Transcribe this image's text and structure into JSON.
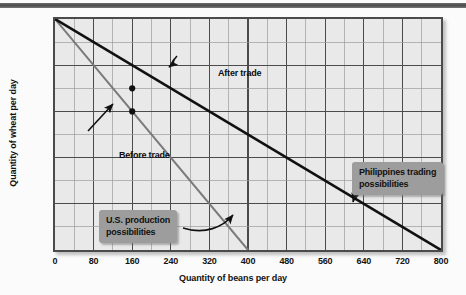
{
  "figure": {
    "background_color": "#fbfbfb",
    "plot_fill": "#e9e9e9",
    "frame_color": "#4b4b4b",
    "callout_color": "#9d9d9d"
  },
  "chart_data": {
    "type": "line",
    "title": "",
    "xlabel": "Quantity of beans per day",
    "ylabel": "Quantity of wheat per day",
    "xlim": [
      0,
      800
    ],
    "ylim": [
      0,
      400
    ],
    "xticks": [
      0,
      80,
      160,
      240,
      320,
      400,
      480,
      560,
      640,
      720,
      800
    ],
    "yticks": [
      0,
      80,
      160,
      240,
      320,
      400
    ],
    "xtick_labels": [
      "0",
      "80",
      "160",
      "240",
      "320",
      "400",
      "480",
      "560",
      "640",
      "720",
      "800"
    ],
    "ytick_labels": [
      "0",
      "80",
      "160",
      "240",
      "320",
      "400"
    ],
    "grid": true,
    "grid_major_step_x": 80,
    "grid_minor_step_x": 40,
    "grid_major_step_y": 80,
    "grid_minor_step_y": 40,
    "legend": "none",
    "series": [
      {
        "name": "U.S. production possibilities",
        "color": "#7a7a7a",
        "width": 2,
        "x": [
          0,
          400
        ],
        "values": [
          400,
          0
        ]
      },
      {
        "name": "Philippines trading possibilities",
        "color": "#111111",
        "width": 2.6,
        "x": [
          0,
          800
        ],
        "values": [
          400,
          0
        ]
      }
    ],
    "points": [
      {
        "label": "Before trade",
        "x": 160,
        "y": 240
      },
      {
        "label": "After trade",
        "x": 160,
        "y": 280
      }
    ],
    "annotations": [
      {
        "name": "after-trade",
        "text": "After trade",
        "style": "plain",
        "points_to": [
          160,
          280
        ]
      },
      {
        "name": "before-trade",
        "text": "Before trade",
        "style": "plain",
        "points_to": [
          160,
          240
        ]
      },
      {
        "name": "us-production",
        "text": "U.S. production\npossibilities",
        "style": "callout",
        "points_to": [
          330,
          55
        ]
      },
      {
        "name": "philippines-trading",
        "text": "Philippines trading\npossibilities",
        "style": "callout",
        "points_to": [
          700,
          50
        ]
      }
    ]
  },
  "axes": {
    "x_title": "Quantity of beans per day",
    "y_title": "Quantity of wheat per day"
  }
}
